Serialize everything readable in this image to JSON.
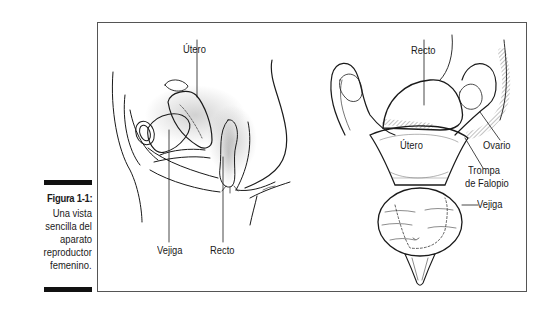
{
  "figure": {
    "number_label": "Figura 1-1:",
    "caption_lines": [
      "Una vista",
      "sencilla del",
      "aparato",
      "reproductor",
      "femenino."
    ]
  },
  "left_illustration": {
    "view": "lateral",
    "labels": {
      "uterus": "Útero",
      "bladder": "Vejiga",
      "rectum": "Recto"
    }
  },
  "right_illustration": {
    "view": "frontal",
    "labels": {
      "rectum": "Recto",
      "uterus": "Útero",
      "ovary": "Ovario",
      "fallopian_tube_line1": "Trompa",
      "fallopian_tube_line2": "de Falopio",
      "bladder": "Vejiga"
    }
  },
  "colors": {
    "frame": "#555555",
    "ink": "#1a1a1a",
    "caption_bar": "#111111"
  }
}
